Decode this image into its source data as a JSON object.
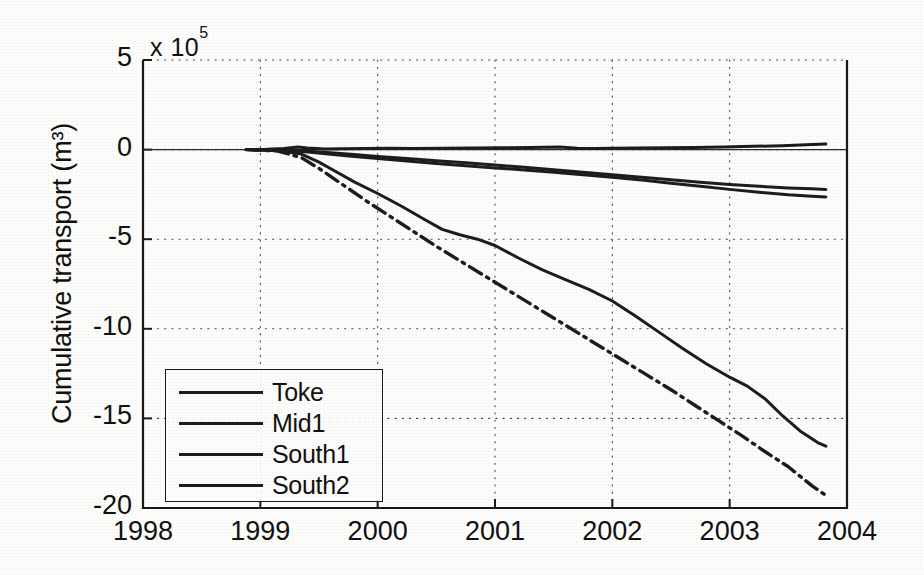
{
  "figure": {
    "background_color": "#fdfdfb",
    "line_color": "#1d1d1d"
  },
  "axes": {
    "ylabel": "Cumulative transport (m³)",
    "exponent_label": "x 10",
    "exponent_power": "5",
    "xlabel": "",
    "x_ticks": [
      "1998",
      "1999",
      "2000",
      "2001",
      "2002",
      "2003",
      "2004"
    ],
    "y_ticks": [
      "5",
      "0",
      "-5",
      "-10",
      "-15",
      "-20"
    ]
  },
  "legend": {
    "entries": [
      {
        "label": "Toke",
        "style": "solid"
      },
      {
        "label": "Mid1",
        "style": "solid"
      },
      {
        "label": "South1",
        "style": "solid"
      },
      {
        "label": "South2",
        "style": "solid"
      }
    ]
  },
  "chart_data": {
    "type": "line",
    "title": "",
    "xlabel": "",
    "ylabel": "Cumulative transport (m³)",
    "y_exponent": 5,
    "y_unit": "m^3",
    "xlim": [
      1998,
      2004
    ],
    "ylim": [
      -20,
      5
    ],
    "x_ticks": [
      1998,
      1999,
      2000,
      2001,
      2002,
      2003,
      2004
    ],
    "y_ticks": [
      5,
      0,
      -5,
      -10,
      -15,
      -20
    ],
    "grid": "dotted, both axes",
    "legend_position": "lower left (inside axes)",
    "data_start_x": 1998.88,
    "data_end_x": 2003.82,
    "series": [
      {
        "name": "Toke",
        "style": "solid",
        "color": "#1d1d1d",
        "x": [
          1998.88,
          1999.05,
          1999.2,
          1999.32,
          1999.4,
          1999.55,
          1999.7,
          1999.9,
          2000.1,
          2000.3,
          2000.55,
          2000.8,
          2001.05,
          2001.3,
          2001.55,
          2001.7,
          2001.85,
          2002.0,
          2002.2,
          2002.45,
          2002.7,
          2002.95,
          2003.2,
          2003.45,
          2003.65,
          2003.82
        ],
        "y": [
          0.0,
          0.02,
          0.06,
          0.14,
          0.09,
          0.04,
          0.05,
          0.06,
          0.07,
          0.06,
          0.07,
          0.09,
          0.1,
          0.12,
          0.14,
          0.08,
          0.06,
          0.07,
          0.09,
          0.1,
          0.12,
          0.14,
          0.18,
          0.22,
          0.27,
          0.31
        ]
      },
      {
        "name": "Mid1",
        "style": "solid",
        "color": "#1d1d1d",
        "x": [
          1998.88,
          1999.1,
          1999.3,
          1999.45,
          1999.6,
          1999.8,
          2000.0,
          2000.25,
          2000.5,
          2000.75,
          2001.0,
          2001.25,
          2001.5,
          2001.75,
          2002.0,
          2002.25,
          2002.5,
          2002.75,
          2003.0,
          2003.25,
          2003.5,
          2003.7,
          2003.82
        ],
        "y": [
          0.0,
          -0.02,
          -0.04,
          -0.1,
          -0.18,
          -0.28,
          -0.38,
          -0.5,
          -0.62,
          -0.74,
          -0.86,
          -0.99,
          -1.12,
          -1.26,
          -1.4,
          -1.54,
          -1.68,
          -1.82,
          -1.95,
          -2.05,
          -2.14,
          -2.19,
          -2.22
        ]
      },
      {
        "name": "South1",
        "style": "solid",
        "color": "#1d1d1d",
        "x": [
          1998.88,
          1999.1,
          1999.3,
          1999.45,
          1999.6,
          1999.8,
          2000.0,
          2000.25,
          2000.5,
          2000.75,
          2001.0,
          2001.25,
          2001.5,
          2001.75,
          2002.0,
          2002.25,
          2002.5,
          2002.75,
          2003.0,
          2003.25,
          2003.5,
          2003.7,
          2003.82
        ],
        "y": [
          0.0,
          -0.03,
          -0.08,
          -0.16,
          -0.26,
          -0.38,
          -0.5,
          -0.64,
          -0.78,
          -0.9,
          -1.02,
          -1.14,
          -1.26,
          -1.4,
          -1.54,
          -1.7,
          -1.88,
          -2.05,
          -2.22,
          -2.38,
          -2.52,
          -2.6,
          -2.64
        ]
      },
      {
        "name": "South2",
        "style": "solid",
        "color": "#1d1d1d",
        "x": [
          1998.88,
          1999.15,
          1999.35,
          1999.5,
          1999.65,
          1999.8,
          2000.0,
          2000.2,
          2000.4,
          2000.55,
          2000.7,
          2000.85,
          2001.0,
          2001.2,
          2001.4,
          2001.6,
          2001.8,
          2002.0,
          2002.2,
          2002.4,
          2002.6,
          2002.8,
          2003.0,
          2003.15,
          2003.3,
          2003.45,
          2003.6,
          2003.75,
          2003.82
        ],
        "y": [
          0.0,
          -0.05,
          -0.25,
          -0.7,
          -1.25,
          -1.8,
          -2.45,
          -3.15,
          -3.9,
          -4.45,
          -4.75,
          -5.0,
          -5.35,
          -6.05,
          -6.7,
          -7.25,
          -7.8,
          -8.45,
          -9.3,
          -10.2,
          -11.1,
          -11.95,
          -12.7,
          -13.2,
          -13.9,
          -14.85,
          -15.7,
          -16.35,
          -16.55
        ]
      },
      {
        "name": "South2-dashdot",
        "style": "dashdot",
        "color": "#1d1d1d",
        "x": [
          1998.88,
          1999.15,
          1999.35,
          1999.5,
          1999.7,
          1999.9,
          2000.1,
          2000.3,
          2000.5,
          2000.7,
          2000.9,
          2001.1,
          2001.3,
          2001.5,
          2001.7,
          2001.9,
          2002.1,
          2002.3,
          2002.5,
          2002.7,
          2002.9,
          2003.1,
          2003.3,
          2003.5,
          2003.7,
          2003.82
        ],
        "y": [
          0.0,
          -0.08,
          -0.45,
          -1.05,
          -1.95,
          -2.85,
          -3.7,
          -4.55,
          -5.4,
          -6.2,
          -7.0,
          -7.8,
          -8.6,
          -9.4,
          -10.2,
          -11.0,
          -11.8,
          -12.6,
          -13.4,
          -14.25,
          -15.1,
          -15.95,
          -16.85,
          -17.7,
          -18.75,
          -19.3
        ]
      }
    ]
  }
}
